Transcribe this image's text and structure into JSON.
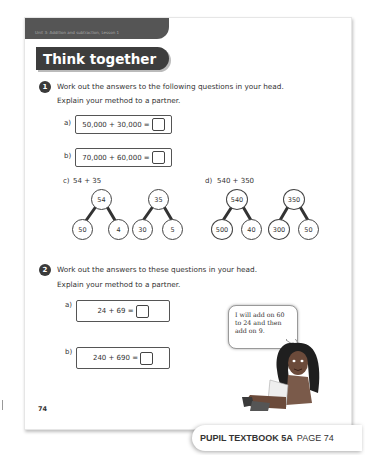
{
  "header": {
    "unit_label": "Unit 3: Addition and subtraction, Lesson 1",
    "section_title": "Think together"
  },
  "question1": {
    "number": "1",
    "instruction_line1": "Work out the answers to the following questions in your head.",
    "instruction_line2": "Explain your method to a partner.",
    "parts": [
      {
        "label": "a)",
        "equation": "50,000 + 30,000 ="
      },
      {
        "label": "b)",
        "equation": "70,000 + 60,000 ="
      }
    ],
    "part_c": {
      "label": "c)",
      "expression": "54 + 35",
      "trees": [
        {
          "whole": "54",
          "parts": [
            "50",
            "4"
          ]
        },
        {
          "whole": "35",
          "parts": [
            "30",
            "5"
          ]
        }
      ]
    },
    "part_d": {
      "label": "d)",
      "expression": "540 + 350",
      "trees": [
        {
          "whole": "540",
          "parts": [
            "500",
            "40"
          ]
        },
        {
          "whole": "350",
          "parts": [
            "300",
            "50"
          ]
        }
      ]
    }
  },
  "question2": {
    "number": "2",
    "instruction_line1": "Work out the answers to these questions in your head.",
    "instruction_line2": "Explain your method to a partner.",
    "parts": [
      {
        "label": "a)",
        "equation": "24 + 69 ="
      },
      {
        "label": "b)",
        "equation": "240 + 690 ="
      }
    ],
    "speech_bubble": "I will add on 60\nto 24 and then\nadd on 9."
  },
  "page_number": "74",
  "footer": {
    "book": "PUPIL TEXTBOOK 5A",
    "page": "PAGE 74"
  }
}
